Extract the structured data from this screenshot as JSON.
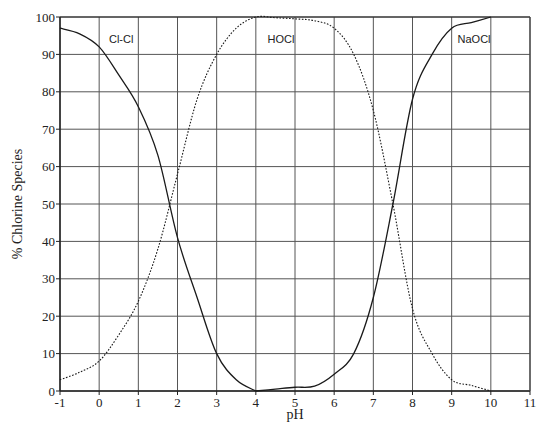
{
  "chart_data": {
    "type": "line",
    "title": "",
    "xlabel": "pH",
    "ylabel": "% Chlorine Species",
    "xlim": [
      -1,
      11
    ],
    "ylim": [
      0,
      100
    ],
    "grid": true,
    "legend": "inline labels",
    "x_ticks": [
      "-1",
      "0",
      "1",
      "2",
      "3",
      "4",
      "5",
      "6",
      "7",
      "8",
      "9",
      "10",
      "11"
    ],
    "y_ticks": [
      "0",
      "10",
      "20",
      "30",
      "40",
      "50",
      "60",
      "70",
      "80",
      "90",
      "100"
    ],
    "series": [
      {
        "name": "Cl-Cl",
        "style": "solid",
        "label_pos": [
          0.25,
          93
        ],
        "x": [
          -1,
          -0.5,
          0,
          0.5,
          1,
          1.5,
          2,
          2.5,
          3,
          3.5,
          4
        ],
        "values": [
          97,
          95.5,
          92,
          84.5,
          76,
          63,
          41,
          25,
          10,
          3,
          0
        ]
      },
      {
        "name": "HOCl",
        "style": "dotted",
        "label_pos": [
          4.3,
          93
        ],
        "x": [
          -1,
          -0.5,
          0,
          0.5,
          1,
          1.5,
          2,
          2.5,
          3,
          3.5,
          4,
          4.5,
          5,
          5.5,
          6,
          6.5,
          7,
          7.5,
          8,
          8.5,
          9,
          9.5,
          10
        ],
        "values": [
          3,
          5,
          8,
          15,
          24,
          38,
          58,
          78,
          90,
          97,
          100,
          99.8,
          99.5,
          99,
          97,
          90,
          75,
          50,
          22,
          10,
          3,
          1.5,
          0
        ]
      },
      {
        "name": "NaOCl",
        "style": "solid",
        "label_pos": [
          9.15,
          93
        ],
        "x": [
          4,
          4.5,
          5,
          5.5,
          6,
          6.5,
          7,
          7.5,
          8,
          8.5,
          9,
          9.5,
          10
        ],
        "values": [
          0,
          0.5,
          1,
          1.3,
          4.5,
          10,
          25,
          50,
          78,
          90,
          97,
          98.5,
          100
        ]
      }
    ]
  }
}
